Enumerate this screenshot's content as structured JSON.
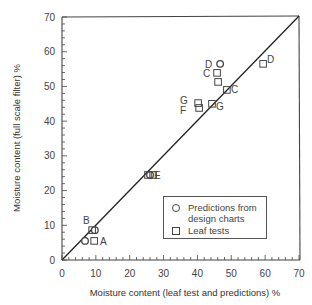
{
  "chart_data": {
    "type": "scatter",
    "title": "",
    "xlabel": "Moisture content (leaf test and predictions)  %",
    "ylabel": "Moisture content (full scale filter)  %",
    "xlim": [
      0,
      70
    ],
    "ylim": [
      0,
      70
    ],
    "x_ticks": [
      0,
      10,
      20,
      30,
      40,
      50,
      60,
      70
    ],
    "y_ticks": [
      0,
      10,
      20,
      30,
      40,
      50,
      60,
      70
    ],
    "grid": false,
    "reference_line": {
      "type": "y=x",
      "from": [
        0,
        0
      ],
      "to": [
        70,
        70
      ]
    },
    "legend_position": "lower right",
    "series": [
      {
        "name": "Predictions from design charts",
        "marker": "circle",
        "points": [
          {
            "x": 46.7,
            "y": 56.5,
            "label": "D"
          },
          {
            "x": 26.0,
            "y": 24.5,
            "label": ""
          },
          {
            "x": 9.7,
            "y": 8.6,
            "label": ""
          },
          {
            "x": 6.8,
            "y": 5.5,
            "label": ""
          }
        ]
      },
      {
        "name": "Leaf tests",
        "marker": "square",
        "points": [
          {
            "x": 59.4,
            "y": 56.5,
            "label": "D"
          },
          {
            "x": 45.8,
            "y": 53.9,
            "label": "C"
          },
          {
            "x": 46.1,
            "y": 51.3,
            "label": ""
          },
          {
            "x": 48.7,
            "y": 49.0,
            "label": "C"
          },
          {
            "x": 44.3,
            "y": 45.0,
            "label": "G"
          },
          {
            "x": 40.2,
            "y": 45.2,
            "label": "G"
          },
          {
            "x": 40.5,
            "y": 43.8,
            "label": "F"
          },
          {
            "x": 25.4,
            "y": 24.5,
            "label": ""
          },
          {
            "x": 26.9,
            "y": 24.5,
            "label": "E"
          },
          {
            "x": 8.9,
            "y": 8.6,
            "label": "B"
          },
          {
            "x": 9.5,
            "y": 5.5,
            "label": "A"
          }
        ]
      }
    ]
  },
  "legend": {
    "entries": [
      {
        "marker": "circle",
        "line1": "Predictions from",
        "line2": "design charts"
      },
      {
        "marker": "square",
        "line1": "Leaf tests"
      }
    ]
  },
  "labels": {
    "D_circle": "D",
    "C_upper": "C",
    "C_right": "C",
    "D_right": "D",
    "G_left": "G",
    "F_left": "F",
    "G_right": "G",
    "E": "E",
    "B": "B",
    "A": "A"
  }
}
